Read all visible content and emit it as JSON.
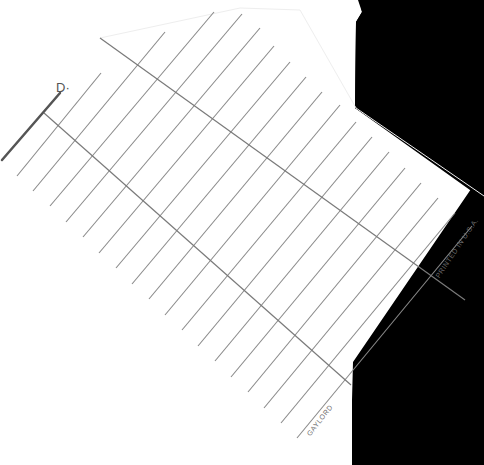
{
  "card": {
    "heading_fragment": "D·",
    "imprint": "PRINTED IN U.S.A.",
    "brand": "GAYLORD"
  },
  "colors": {
    "paper": "#ffffff",
    "rule_line": "#8a8a8a",
    "background_black": "#000000",
    "heavy_stroke": "#555555"
  }
}
